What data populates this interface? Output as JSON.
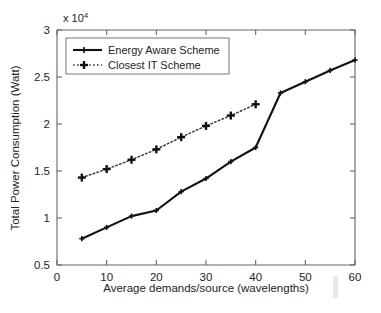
{
  "chart_data": {
    "type": "line",
    "title": "",
    "xlabel": "Average demands/source (wavelengths)",
    "ylabel": "Total Power Consumption (Watt)",
    "y_multiplier_label": "x 10",
    "y_multiplier_exponent": "4",
    "xlim": [
      0,
      60
    ],
    "ylim": [
      0.5,
      3
    ],
    "xticks": [
      0,
      10,
      20,
      30,
      40,
      50,
      60
    ],
    "xtick_labels": [
      "0",
      "10",
      "20",
      "30",
      "40",
      "50",
      "60"
    ],
    "yticks": [
      0.5,
      1,
      1.5,
      2,
      2.5,
      3
    ],
    "ytick_labels": [
      "0.5",
      "1",
      "1.5",
      "2",
      "2.5",
      "3"
    ],
    "grid": false,
    "legend_position": "top-left",
    "series": [
      {
        "name": "Energy Aware Scheme",
        "style": "solid",
        "marker": "plus-small",
        "color": "#111111",
        "x": [
          5,
          10,
          15,
          20,
          25,
          30,
          35,
          40,
          45,
          50,
          55,
          60
        ],
        "values": [
          0.78,
          0.9,
          1.02,
          1.08,
          1.28,
          1.42,
          1.6,
          1.75,
          2.33,
          2.45,
          2.57,
          2.68
        ]
      },
      {
        "name": "Closest IT Scheme",
        "style": "dotted",
        "marker": "plus-bold",
        "color": "#3a3a3a",
        "x": [
          5,
          10,
          15,
          20,
          25,
          30,
          35,
          40
        ],
        "values": [
          1.43,
          1.52,
          1.62,
          1.73,
          1.86,
          1.98,
          2.09,
          2.21
        ]
      }
    ]
  },
  "legend": {
    "entries": [
      {
        "label": "Energy Aware Scheme"
      },
      {
        "label": "Closest IT Scheme"
      }
    ]
  }
}
